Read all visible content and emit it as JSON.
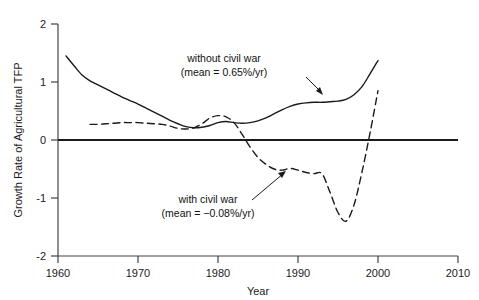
{
  "chart_data": {
    "type": "line",
    "title": "",
    "xlabel": "Year",
    "ylabel": "Growth Rate of Agricultural TFP",
    "xlim": [
      1960,
      2010
    ],
    "ylim": [
      -2,
      2
    ],
    "xticks": [
      1960,
      1970,
      1980,
      1990,
      2000,
      2010
    ],
    "yticks": [
      -2,
      -1,
      0,
      1,
      2
    ],
    "grid": false,
    "legend": "annotations-inline",
    "zero_line": 0,
    "series": [
      {
        "name": "without civil war",
        "style": "solid",
        "mean_label": "mean = 0.65%/yr",
        "x": [
          1961,
          1962,
          1963,
          1964,
          1965,
          1966,
          1967,
          1968,
          1969,
          1970,
          1971,
          1972,
          1973,
          1974,
          1975,
          1976,
          1977,
          1978,
          1979,
          1980,
          1981,
          1982,
          1983,
          1984,
          1985,
          1986,
          1987,
          1988,
          1989,
          1990,
          1991,
          1992,
          1993,
          1994,
          1995,
          1996,
          1997,
          1998,
          1999,
          2000
        ],
        "values": [
          1.45,
          1.28,
          1.12,
          1.02,
          0.95,
          0.88,
          0.81,
          0.74,
          0.68,
          0.62,
          0.55,
          0.48,
          0.41,
          0.34,
          0.28,
          0.23,
          0.21,
          0.22,
          0.25,
          0.3,
          0.32,
          0.3,
          0.29,
          0.3,
          0.33,
          0.38,
          0.45,
          0.52,
          0.58,
          0.62,
          0.64,
          0.65,
          0.65,
          0.66,
          0.67,
          0.7,
          0.78,
          0.92,
          1.14,
          1.37
        ]
      },
      {
        "name": "with civil war",
        "style": "dashed",
        "mean_label": "mean = −0.08%/yr",
        "x": [
          1964,
          1965,
          1966,
          1967,
          1968,
          1969,
          1970,
          1971,
          1972,
          1973,
          1974,
          1975,
          1976,
          1977,
          1978,
          1979,
          1980,
          1981,
          1982,
          1983,
          1984,
          1985,
          1986,
          1987,
          1988,
          1989,
          1990,
          1991,
          1992,
          1993,
          1994,
          1995,
          1996,
          1997,
          1998,
          1999,
          2000
        ],
        "values": [
          0.27,
          0.27,
          0.28,
          0.29,
          0.3,
          0.3,
          0.3,
          0.29,
          0.28,
          0.27,
          0.24,
          0.2,
          0.19,
          0.21,
          0.28,
          0.38,
          0.42,
          0.4,
          0.3,
          0.1,
          -0.12,
          -0.3,
          -0.42,
          -0.5,
          -0.52,
          -0.49,
          -0.52,
          -0.56,
          -0.58,
          -0.58,
          -0.9,
          -1.25,
          -1.4,
          -1.12,
          -0.55,
          0.12,
          0.85
        ]
      }
    ],
    "annotations": [
      {
        "id": "without-civil-war",
        "lines": [
          "without civil war",
          "(mean = 0.65%/yr)"
        ],
        "text_x": 224,
        "text_y": 62,
        "arrow": {
          "x1": 306,
          "y1": 77,
          "x2": 322,
          "y2": 93
        }
      },
      {
        "id": "with-civil-war",
        "lines": [
          "with civil war",
          "(mean = −0.08%/yr)"
        ],
        "text_x": 208,
        "text_y": 203,
        "arrow": {
          "x1": 252,
          "y1": 200,
          "x2": 284,
          "y2": 172
        }
      }
    ]
  },
  "colors": {
    "ink": "#1a1a1a",
    "axis": "#444444",
    "line": "#1a1a1a"
  }
}
